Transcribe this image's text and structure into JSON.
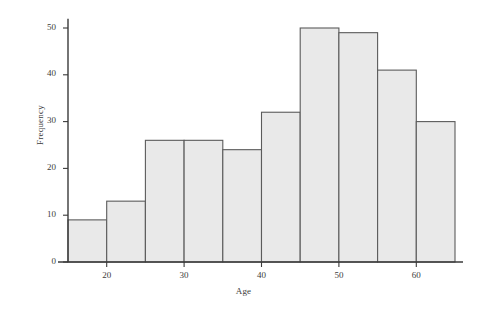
{
  "chart_data": {
    "type": "bar",
    "title": "",
    "xlabel": "Age",
    "ylabel": "Frequency",
    "categories": [
      "15-20",
      "20-25",
      "25-30",
      "30-35",
      "35-40",
      "40-45",
      "45-50",
      "50-55",
      "55-60",
      "60-65"
    ],
    "bin_edges": [
      15,
      20,
      25,
      30,
      35,
      40,
      45,
      50,
      55,
      60,
      65
    ],
    "bin_width": 5,
    "values": [
      9,
      13,
      26,
      26,
      24,
      32,
      50,
      49,
      41,
      30
    ],
    "xlim": [
      15,
      65
    ],
    "ylim": [
      0,
      52
    ],
    "xticks": [
      20,
      30,
      40,
      50,
      60
    ],
    "yticks": [
      0,
      10,
      20,
      30,
      40,
      50
    ],
    "xtick_labels": [
      "20",
      "30",
      "40",
      "50",
      "60"
    ],
    "ytick_labels": [
      "0",
      "10",
      "20",
      "30",
      "40",
      "50"
    ],
    "grid": false,
    "legend": null,
    "colors": {
      "bar_fill": "#e9e9e9",
      "bar_edge": "#5b5b5b",
      "axis": "#3a3a3a",
      "text": "#3c3c3c",
      "background": "#ffffff"
    }
  }
}
